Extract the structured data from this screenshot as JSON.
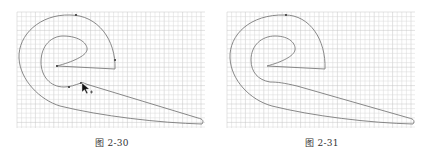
{
  "figures": [
    {
      "caption": "图 2-30",
      "grid": {
        "x": 17,
        "y": 12,
        "w": 188,
        "h": 116,
        "step": 4.6,
        "color": "#d8d8d8",
        "major_color": "#c4c4c4"
      },
      "stroke_color": "#7a7a7a",
      "outer_path": "M 70 15 C 40 14, 18 35, 19 58 C 20 80, 40 100, 60 106 C 100 116, 160 123, 202 124 C 204 121, 203 119, 198 118 L 86 84 C 84 83, 82 82, 81 83 C 75 85, 70 87, 64 87 C 50 87, 41 76, 41 62 C 41 45, 52 36, 63 36 C 80 36, 88 44, 87 50 C 86 56, 72 62, 57 66 L 115 69 C 116 40, 98 15, 70 15 Z",
      "anchor_points": [
        [
          76,
          15
        ],
        [
          115,
          60
        ],
        [
          69,
          87
        ],
        [
          81,
          83
        ],
        [
          57,
          66
        ]
      ],
      "cursor": {
        "x": 82,
        "y": 83,
        "visible": true
      }
    },
    {
      "caption": "图 2-31",
      "grid": {
        "x": 227,
        "y": 12,
        "w": 188,
        "h": 116,
        "step": 4.6,
        "color": "#d8d8d8",
        "major_color": "#c4c4c4"
      },
      "stroke_color": "#7a7a7a",
      "outer_path": "M 285 15 C 250 14, 229 35, 230 58 C 231 80, 250 100, 272 106 C 312 116, 370 123, 413 124 C 415 121, 414 119, 409 118 L 297 86 C 284 83, 278 82, 270 82 C 258 80, 251 72, 251 60 C 251 45, 262 36, 275 36 C 290 36, 296 44, 295 50 C 294 56, 282 62, 267 66 L 325 69 C 326 40, 310 15, 285 15 Z",
      "anchor_points": [
        [
          286,
          15
        ]
      ],
      "cursor": {
        "visible": false
      }
    }
  ]
}
